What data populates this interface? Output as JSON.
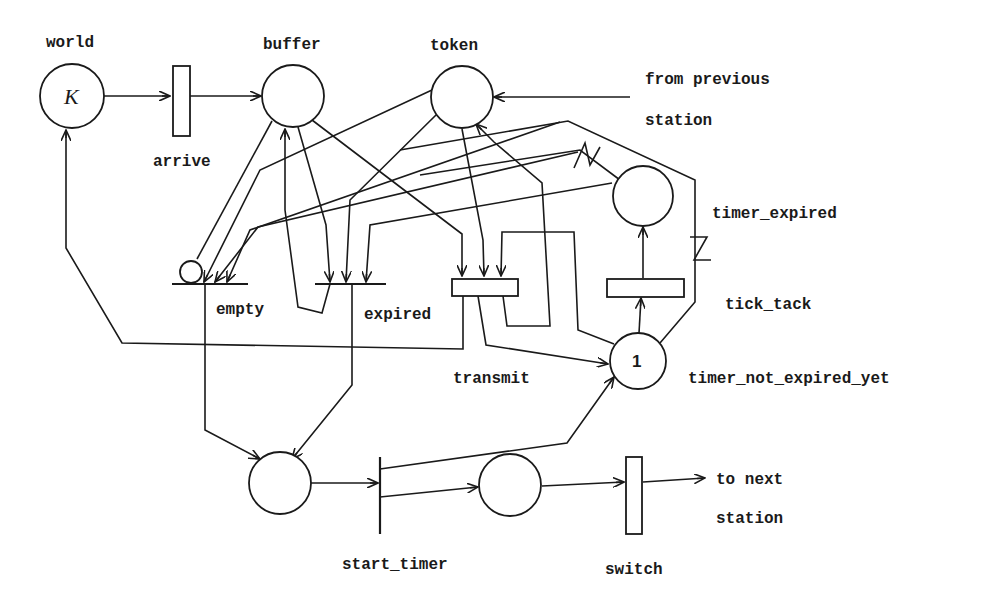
{
  "diagram": {
    "type": "petri-net",
    "colors": {
      "stroke": "#1a1a1a",
      "background": "#ffffff"
    },
    "places": [
      {
        "id": "world",
        "label": "world",
        "marking": "K"
      },
      {
        "id": "buffer",
        "label": "buffer",
        "marking": ""
      },
      {
        "id": "token",
        "label": "token",
        "marking": ""
      },
      {
        "id": "timer_expired",
        "label": "timer_expired",
        "marking": ""
      },
      {
        "id": "timer_not_expired_yet",
        "label": "timer_not_expired_yet",
        "marking": "1"
      },
      {
        "id": "p_wait",
        "label": "",
        "marking": ""
      },
      {
        "id": "p_send",
        "label": "",
        "marking": ""
      }
    ],
    "transitions": [
      {
        "id": "arrive",
        "label": "arrive"
      },
      {
        "id": "empty",
        "label": "empty"
      },
      {
        "id": "expired",
        "label": "expired"
      },
      {
        "id": "transmit",
        "label": "transmit"
      },
      {
        "id": "tick_tack",
        "label": "tick_tack"
      },
      {
        "id": "start_timer",
        "label": "start_timer"
      },
      {
        "id": "switch",
        "label": "switch"
      }
    ],
    "external": {
      "from_previous_line1": "from previous",
      "from_previous_line2": "station",
      "to_next_line1": "to next",
      "to_next_line2": "station"
    }
  }
}
